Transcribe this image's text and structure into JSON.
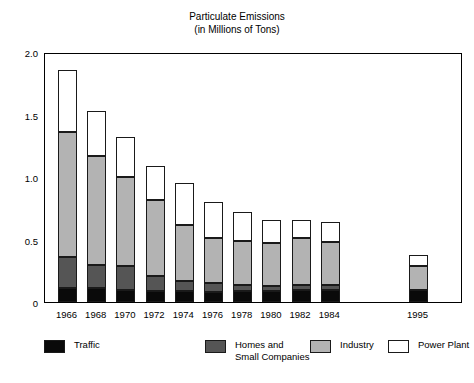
{
  "chart_data": {
    "type": "bar",
    "subtype": "stacked-bar",
    "title": "Particulate Emissions",
    "subtitle": "(in Millions of Tons)",
    "xlabel": "",
    "ylabel": "",
    "ylim": [
      0,
      2.0
    ],
    "yticks": [
      0,
      0.5,
      1.0,
      1.5,
      2.0
    ],
    "ytick_labels": [
      "0",
      "0.5",
      "1.0",
      "1.5",
      "2.0"
    ],
    "grid": false,
    "legend_position": "bottom",
    "categories": [
      "1966",
      "1968",
      "1970",
      "1972",
      "1974",
      "1976",
      "1978",
      "1980",
      "1982",
      "1984",
      "1995"
    ],
    "series": [
      {
        "name": "Traffic",
        "color": "#0a0a0a",
        "values": [
          0.11,
          0.11,
          0.1,
          0.09,
          0.09,
          0.08,
          0.09,
          0.09,
          0.1,
          0.1,
          0.1
        ]
      },
      {
        "name": "Homes and\nSmall Companies",
        "color": "#555555",
        "values": [
          0.25,
          0.19,
          0.19,
          0.12,
          0.08,
          0.07,
          0.05,
          0.04,
          0.04,
          0.04,
          0.0
        ]
      },
      {
        "name": "Industry",
        "color": "#b3b3b3",
        "values": [
          1.0,
          0.87,
          0.71,
          0.61,
          0.45,
          0.36,
          0.35,
          0.34,
          0.37,
          0.34,
          0.19
        ]
      },
      {
        "name": "Power Plant",
        "color": "#ffffff",
        "values": [
          0.5,
          0.36,
          0.32,
          0.27,
          0.33,
          0.29,
          0.23,
          0.19,
          0.15,
          0.16,
          0.09
        ]
      }
    ],
    "totals": [
      1.86,
      1.53,
      1.32,
      1.09,
      0.95,
      0.8,
      0.72,
      0.66,
      0.66,
      0.64,
      0.38
    ],
    "annotations": []
  },
  "legend": {
    "items": [
      {
        "label": "Traffic",
        "swatch": "sw-traffic"
      },
      {
        "label": "Homes and\nSmall Companies",
        "swatch": "sw-homes"
      },
      {
        "label": "Industry",
        "swatch": "sw-industry"
      },
      {
        "label": "Power Plant",
        "swatch": "sw-power"
      }
    ]
  }
}
